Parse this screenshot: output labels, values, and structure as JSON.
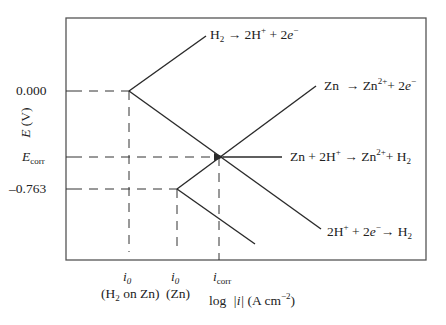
{
  "diagram": {
    "type": "evans_diagram",
    "y_axis": {
      "label_var": "E",
      "label_unit": "(V)",
      "ticks": [
        {
          "label": "0.000",
          "y": 91
        },
        {
          "label": "E",
          "label_sub": "corr",
          "y": 157
        },
        {
          "label": "–0.763",
          "y": 189
        }
      ]
    },
    "x_axis": {
      "label_prefix": "log",
      "label_var": "|i|",
      "label_unit": "(A cm",
      "label_unit_exp": "−2",
      "label_close": ")",
      "ticks": [
        {
          "var": "i",
          "sub": "0",
          "desc": "(H",
          "desc_sub": "2",
          "desc_rest": " on Zn)",
          "x": 129
        },
        {
          "var": "i",
          "sub": "0",
          "desc": "(Zn)",
          "x": 177
        },
        {
          "var": "i",
          "sub": "corr",
          "x": 219
        }
      ]
    },
    "reactions": {
      "h2_oxidation": {
        "lhs": "H",
        "lhs_sub": "2",
        "arrow": "→",
        "rhs1": "2H",
        "rhs1_sup": "+",
        "plus": "+ 2",
        "e": "e",
        "e_sup": "−"
      },
      "zn_oxidation": {
        "lhs": "Zn",
        "arrow": "→",
        "rhs1": "Zn",
        "rhs1_sup": "2+",
        "plus": "+ 2",
        "e": "e",
        "e_sup": "−"
      },
      "overall": {
        "lhs": "Zn + 2H",
        "lhs_sup": "+",
        "arrow": "→",
        "rhs1": "Zn",
        "rhs1_sup": "2+",
        "rhs2": "+ H",
        "rhs2_sub": "2"
      },
      "h_reduction": {
        "lhs": "2H",
        "lhs_sup": "+",
        "plus": "+ 2",
        "e": "e",
        "e_sup": "−",
        "arrow": "→",
        "rhs": "H",
        "rhs_sub": "2"
      }
    },
    "colors": {
      "line": "#2a2a2a",
      "frame": "#555555",
      "text": "#222222"
    }
  }
}
